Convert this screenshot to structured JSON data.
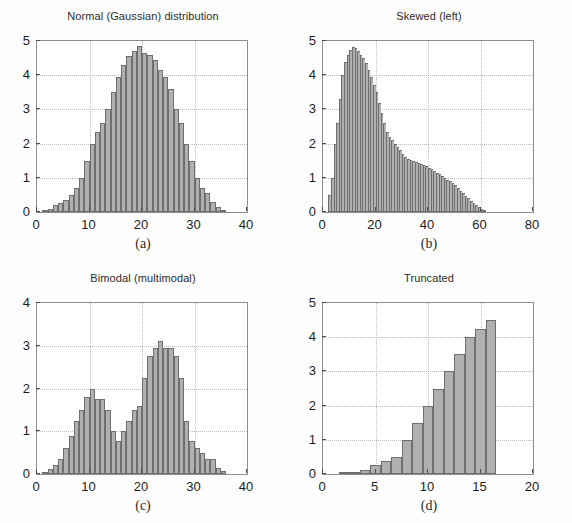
{
  "figure": {
    "background": "#ffffff",
    "bar_fill": "#b0b0b0",
    "bar_edge": "#6e6e6e",
    "axis_color": "#8d8d8d",
    "grid_color": "#b9b9b9"
  },
  "chart_data": [
    {
      "type": "bar",
      "panel": "a",
      "caption": "(a)",
      "title": "Normal (Gaussian) distribution",
      "xlabel": "",
      "ylabel": "",
      "xlim": [
        0,
        40
      ],
      "ylim": [
        0,
        5
      ],
      "xticks": [
        0,
        10,
        20,
        30,
        40
      ],
      "yticks": [
        0,
        1,
        2,
        3,
        4,
        5
      ],
      "grid": true,
      "bin_width": 1,
      "bin_starts": [
        1,
        2,
        3,
        4,
        5,
        6,
        7,
        8,
        9,
        10,
        11,
        12,
        13,
        14,
        15,
        16,
        17,
        18,
        19,
        20,
        21,
        22,
        23,
        24,
        25,
        26,
        27,
        28,
        29,
        30,
        31,
        32,
        33,
        34,
        35
      ],
      "values": [
        0.05,
        0.1,
        0.2,
        0.25,
        0.35,
        0.5,
        0.7,
        1.0,
        1.5,
        2.0,
        2.35,
        2.6,
        3.0,
        3.5,
        3.95,
        4.3,
        4.55,
        4.7,
        4.85,
        4.65,
        4.6,
        4.45,
        4.15,
        3.95,
        3.6,
        3.0,
        2.6,
        2.0,
        1.5,
        1.0,
        0.7,
        0.55,
        0.3,
        0.15,
        0.07
      ]
    },
    {
      "type": "bar",
      "panel": "b",
      "caption": "(b)",
      "title": "Skewed (left)",
      "xlabel": "",
      "ylabel": "",
      "xlim": [
        0,
        80
      ],
      "ylim": [
        0,
        5
      ],
      "xticks": [
        0,
        20,
        40,
        60,
        80
      ],
      "yticks": [
        0,
        1,
        2,
        3,
        4,
        5
      ],
      "grid": true,
      "bin_width": 1,
      "bin_starts": [
        2,
        3,
        4,
        5,
        6,
        7,
        8,
        9,
        10,
        11,
        12,
        13,
        14,
        15,
        16,
        17,
        18,
        19,
        20,
        21,
        22,
        23,
        24,
        25,
        26,
        27,
        28,
        29,
        30,
        31,
        32,
        33,
        34,
        35,
        36,
        37,
        38,
        39,
        40,
        41,
        42,
        43,
        44,
        45,
        46,
        47,
        48,
        49,
        50,
        51,
        52,
        53,
        54,
        55,
        56,
        57,
        58,
        59,
        60,
        61
      ],
      "values": [
        0.5,
        1.0,
        2.0,
        2.6,
        3.3,
        4.0,
        4.4,
        4.6,
        4.75,
        4.82,
        4.8,
        4.7,
        4.6,
        4.5,
        4.35,
        4.15,
        3.95,
        3.7,
        3.5,
        3.2,
        2.9,
        2.6,
        2.35,
        2.2,
        2.1,
        2.0,
        1.9,
        1.8,
        1.7,
        1.62,
        1.55,
        1.52,
        1.5,
        1.47,
        1.44,
        1.41,
        1.38,
        1.35,
        1.3,
        1.25,
        1.2,
        1.15,
        1.1,
        1.05,
        1.0,
        0.95,
        0.9,
        0.85,
        0.78,
        0.7,
        0.62,
        0.55,
        0.48,
        0.4,
        0.33,
        0.27,
        0.2,
        0.14,
        0.08,
        0.03
      ]
    },
    {
      "type": "bar",
      "panel": "c",
      "caption": "(c)",
      "title": "Bimodal (multimodal)",
      "xlabel": "",
      "ylabel": "",
      "xlim": [
        0,
        40
      ],
      "ylim": [
        0,
        4
      ],
      "xticks": [
        0,
        10,
        20,
        30,
        40
      ],
      "yticks": [
        0,
        1,
        2,
        3,
        4
      ],
      "grid": true,
      "bin_width": 1,
      "bin_starts": [
        1,
        2,
        3,
        4,
        5,
        6,
        7,
        8,
        9,
        10,
        11,
        12,
        13,
        14,
        15,
        16,
        17,
        18,
        19,
        20,
        21,
        22,
        23,
        24,
        25,
        26,
        27,
        28,
        29,
        30,
        31,
        32,
        33,
        34,
        35
      ],
      "values": [
        0.05,
        0.12,
        0.2,
        0.35,
        0.6,
        0.9,
        1.25,
        1.5,
        1.8,
        2.0,
        1.75,
        1.75,
        1.5,
        1.0,
        0.78,
        1.0,
        1.25,
        1.5,
        1.6,
        2.25,
        2.75,
        2.95,
        3.12,
        2.95,
        2.95,
        2.75,
        2.25,
        1.25,
        0.78,
        0.6,
        0.5,
        0.35,
        0.35,
        0.15,
        0.07
      ]
    },
    {
      "type": "bar",
      "panel": "d",
      "caption": "(d)",
      "title": "Truncated",
      "xlabel": "",
      "ylabel": "",
      "xlim": [
        0,
        20
      ],
      "ylim": [
        0,
        5
      ],
      "xticks": [
        0,
        5,
        10,
        15,
        20
      ],
      "yticks": [
        0,
        1,
        2,
        3,
        4,
        5
      ],
      "grid": true,
      "bin_width": 1,
      "bin_starts": [
        1.5,
        2.5,
        3.5,
        4.5,
        5.5,
        6.5,
        7.5,
        8.5,
        9.5,
        10.5,
        11.5,
        12.5,
        13.5,
        14.5,
        15.5
      ],
      "values": [
        0.03,
        0.07,
        0.13,
        0.25,
        0.38,
        0.5,
        1.0,
        1.5,
        2.0,
        2.5,
        3.0,
        3.5,
        4.0,
        4.25,
        4.5
      ]
    }
  ]
}
